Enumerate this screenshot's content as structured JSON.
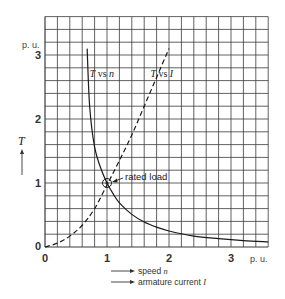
{
  "chart_data": {
    "type": "line",
    "title": "",
    "xlabel": [
      "speed n",
      "armature current I"
    ],
    "ylabel": "T",
    "x_unit": "p. u.",
    "y_unit": "p. u.",
    "xlim": [
      0,
      3.6
    ],
    "ylim": [
      0,
      3.6
    ],
    "x_ticks": [
      "0",
      "1",
      "2",
      "3"
    ],
    "y_ticks": [
      "0",
      "1",
      "2",
      "3"
    ],
    "grid": true,
    "grid_step": 0.2,
    "legend": null,
    "series": [
      {
        "name": "T vs n",
        "style": "solid",
        "x": [
          0.68,
          0.72,
          0.8,
          0.9,
          1.0,
          1.1,
          1.2,
          1.4,
          1.6,
          1.8,
          2.0,
          2.4,
          2.8,
          3.2,
          3.6
        ],
        "y": [
          3.1,
          2.2,
          1.56,
          1.23,
          1.0,
          0.83,
          0.69,
          0.51,
          0.39,
          0.31,
          0.25,
          0.17,
          0.13,
          0.1,
          0.08
        ]
      },
      {
        "name": "T vs I",
        "style": "dashed",
        "x": [
          0.0,
          0.2,
          0.4,
          0.6,
          0.8,
          1.0,
          1.2,
          1.4,
          1.6,
          1.8,
          2.0
        ],
        "y": [
          0.0,
          0.06,
          0.17,
          0.34,
          0.6,
          0.97,
          1.35,
          1.75,
          2.2,
          2.65,
          3.1
        ]
      }
    ],
    "annotations": [
      {
        "text": "rated load",
        "x": 1.0,
        "y": 1.0,
        "marker": "circle"
      }
    ]
  },
  "labels": {
    "y_unit": "p. u.",
    "x_unit": "p. u.",
    "y_axis_symbol": "T",
    "curve_n": {
      "sym": "T",
      "vs": " vs ",
      "var": "n"
    },
    "curve_i": {
      "sym": "T",
      "vs": " vs ",
      "var": "I"
    },
    "rated_load": "rated load",
    "x_speed": {
      "text": "speed ",
      "var": "n"
    },
    "x_current": {
      "text": "armature current ",
      "var": "I"
    },
    "ticks_x": [
      "0",
      "1",
      "2",
      "3"
    ],
    "ticks_y": [
      "0",
      "1",
      "2",
      "3"
    ]
  }
}
